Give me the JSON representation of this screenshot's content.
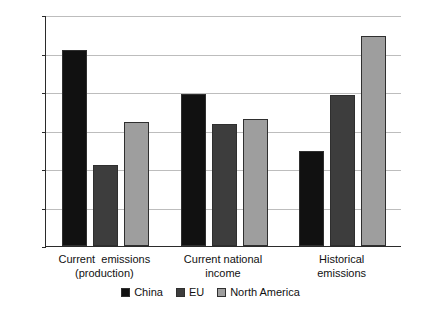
{
  "chart_data": {
    "type": "bar",
    "title": "",
    "subtitle": "",
    "xlabel": "",
    "ylabel": "Share in world total (%)",
    "ylim": [
      0,
      30
    ],
    "yticks": [
      0,
      5,
      10,
      15,
      20,
      25,
      30
    ],
    "ytick_labels": [
      "0",
      "5",
      "10",
      "15",
      "20",
      "25",
      "30"
    ],
    "grid": true,
    "legend_position": "bottom-center",
    "categories": [
      "Current  emissions\n(production)",
      "Current national\nincome",
      "Historical\nemissions"
    ],
    "category_lines": [
      [
        "Current  emissions",
        "(production)"
      ],
      [
        "Current national",
        "income"
      ],
      [
        "Historical",
        "emissions"
      ]
    ],
    "series": [
      {
        "name": "China",
        "color": "#111111",
        "values": [
          25.5,
          19.7,
          12.3
        ]
      },
      {
        "name": "EU",
        "color": "#3d3d3d",
        "values": [
          10.5,
          15.8,
          19.6
        ]
      },
      {
        "name": "North America",
        "color": "#9e9e9e",
        "values": [
          16.1,
          16.5,
          27.3
        ]
      }
    ],
    "annotations": []
  },
  "figure": {
    "background": "#ffffff",
    "axis_color": "#2b2b2b",
    "gridline_color": "#bdbdbd"
  },
  "legend": {
    "items": [
      {
        "label": "China",
        "color": "#111111"
      },
      {
        "label": "EU",
        "color": "#3d3d3d"
      },
      {
        "label": "North America",
        "color": "#9e9e9e"
      }
    ]
  }
}
